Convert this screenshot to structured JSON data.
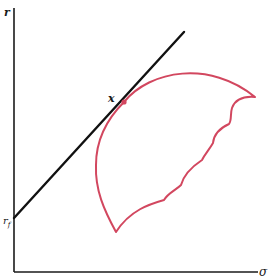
{
  "diagram": {
    "type": "risk-return feasible set with capital market line",
    "axes": {
      "y_label": "r",
      "x_label": "σ"
    },
    "line": {
      "intercept_label": "r",
      "intercept_subscript": "f",
      "color": "#111111"
    },
    "feasible_set": {
      "color": "#d2475f",
      "tangent_point_label": "x"
    }
  }
}
